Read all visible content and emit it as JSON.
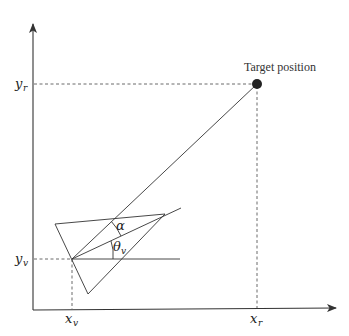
{
  "diagram": {
    "title": "",
    "target_label": "Target position",
    "labels": {
      "y_r": {
        "base": "y",
        "sub": "r"
      },
      "y_v": {
        "base": "y",
        "sub": "v"
      },
      "x_v": {
        "base": "x",
        "sub": "v"
      },
      "x_r": {
        "base": "x",
        "sub": "r"
      },
      "alpha": "α",
      "theta_v": {
        "base": "θ",
        "sub": "v"
      }
    },
    "colors": {
      "stroke": "#333333",
      "target_dot": "#222222",
      "background": "#ffffff"
    },
    "points": {
      "origin": [
        33,
        310
      ],
      "vehicle": [
        72,
        259
      ],
      "target": [
        257,
        84
      ],
      "triangle": [
        [
          55,
          224
        ],
        [
          165,
          214
        ],
        [
          88,
          294
        ]
      ]
    }
  }
}
